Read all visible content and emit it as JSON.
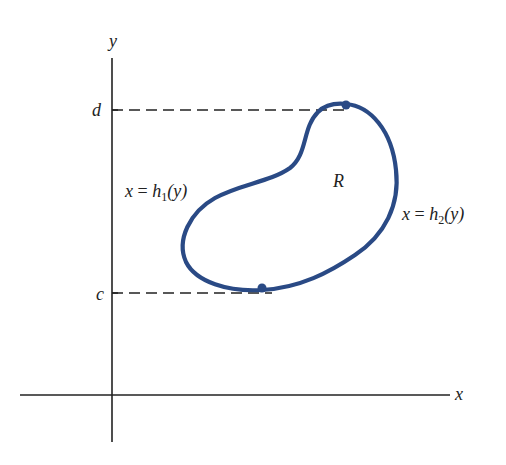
{
  "diagram": {
    "type": "region-type-II",
    "axes": {
      "x_label": "x",
      "y_label": "y"
    },
    "bounds": {
      "top_label": "d",
      "bottom_label": "c"
    },
    "region_label": "R",
    "left_curve": {
      "lhs": "x",
      "eq": "=",
      "func": "h",
      "sub": "1",
      "arg": "(y)"
    },
    "right_curve": {
      "lhs": "x",
      "eq": "=",
      "func": "h",
      "sub": "2",
      "arg": "(y)"
    },
    "colors": {
      "curve": "#2a4a85",
      "axes": "#222222",
      "dash": "#222222"
    }
  }
}
